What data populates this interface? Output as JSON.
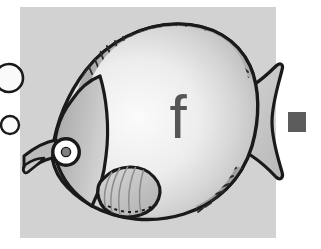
{
  "scene": {
    "title": "Fish illustration with letter f",
    "canvas": {
      "width": 321,
      "height": 249,
      "background": "#ffffff"
    }
  },
  "background_card": {
    "name": "gray-background-card",
    "x": 20,
    "y": 7,
    "width": 256,
    "height": 231,
    "color": "#d2d2d2"
  },
  "letter_overlay": {
    "character": "f",
    "color": "#555555",
    "x": 178,
    "y": 138
  },
  "fish": {
    "name": "butterflyfish",
    "body_color_light": "#f2f2f2",
    "body_color_mid": "#c9c9c9",
    "head_color": "#b4b4b4",
    "fin_color": "#a8a8a8",
    "outline_color": "#1a1a1a",
    "parts": [
      {
        "label": "body"
      },
      {
        "label": "head"
      },
      {
        "label": "eye"
      },
      {
        "label": "mouth"
      },
      {
        "label": "dorsal-fin"
      },
      {
        "label": "anal-fin"
      },
      {
        "label": "pectoral-fin"
      },
      {
        "label": "tail-fin"
      }
    ]
  },
  "bubbles": [
    {
      "name": "bubble-large",
      "cx": 9,
      "cy": 78,
      "r": 14
    },
    {
      "name": "bubble-small",
      "cx": 10,
      "cy": 125,
      "r": 9
    }
  ],
  "accent_square": {
    "name": "gray-accent-square",
    "x": 288,
    "y": 112,
    "width": 18,
    "height": 20,
    "color": "#5c5c5c"
  }
}
